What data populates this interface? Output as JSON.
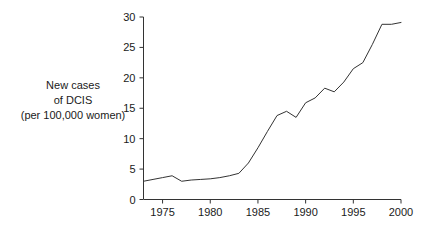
{
  "chart_data": {
    "type": "line",
    "title": "",
    "subtitle": "",
    "xlabel": "",
    "ylabel": "New cases of DCIS (per 100,000 women)",
    "ylabel_lines": [
      "New cases",
      "of DCIS",
      "(per 100,000 women)"
    ],
    "xlim": [
      1973,
      2000
    ],
    "ylim": [
      0,
      30
    ],
    "xticks": [
      1975,
      1980,
      1985,
      1990,
      1995,
      2000
    ],
    "xtick_labels": [
      "1975",
      "1980",
      "1985",
      "1990",
      "1995",
      "2000"
    ],
    "yticks": [
      0,
      5,
      10,
      15,
      20,
      25,
      30
    ],
    "ytick_labels": [
      "0",
      "5",
      "10",
      "15",
      "20",
      "25",
      "30"
    ],
    "grid": false,
    "legend": false,
    "legend_position": "none",
    "line_color": "#333333",
    "axis_color": "#333333",
    "background_color": "#ffffff",
    "x": [
      1973,
      1974,
      1975,
      1976,
      1977,
      1978,
      1979,
      1980,
      1981,
      1982,
      1983,
      1984,
      1985,
      1986,
      1987,
      1988,
      1989,
      1990,
      1991,
      1992,
      1993,
      1994,
      1995,
      1996,
      1997,
      1998,
      1999,
      2000
    ],
    "values": [
      3.0,
      3.3,
      3.6,
      3.9,
      3.0,
      3.2,
      3.3,
      3.4,
      3.6,
      3.9,
      4.3,
      6.0,
      8.5,
      11.2,
      13.8,
      14.5,
      13.5,
      15.9,
      16.7,
      18.3,
      17.7,
      19.3,
      21.5,
      22.5,
      25.5,
      28.8,
      28.8,
      29.1
    ],
    "series": [
      {
        "name": "New cases of DCIS",
        "values": [
          3.0,
          3.3,
          3.6,
          3.9,
          3.0,
          3.2,
          3.3,
          3.4,
          3.6,
          3.9,
          4.3,
          6.0,
          8.5,
          11.2,
          13.8,
          14.5,
          13.5,
          15.9,
          16.7,
          18.3,
          17.7,
          19.3,
          21.5,
          22.5,
          25.5,
          28.8,
          28.8,
          29.1
        ]
      }
    ],
    "annotations": []
  }
}
